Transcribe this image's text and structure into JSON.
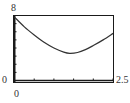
{
  "chart_data": {
    "type": "line",
    "title": "",
    "xlabel": "",
    "ylabel": "",
    "xlim": [
      0,
      2.5
    ],
    "ylim": [
      0,
      8
    ],
    "x_tick_step": 0.5,
    "y_tick_step": 1,
    "grid": false,
    "legend": null,
    "labels": {
      "ymax": "8",
      "ymin": "0",
      "xmin": "0",
      "xmax": "2.5"
    },
    "series": [
      {
        "name": "curve",
        "x": [
          0,
          0.25,
          0.5,
          0.75,
          1.0,
          1.25,
          1.4,
          1.6,
          1.8,
          2.0,
          2.25,
          2.5
        ],
        "y": [
          7.8,
          6.6,
          5.6,
          4.7,
          4.0,
          3.5,
          3.35,
          3.45,
          3.8,
          4.3,
          5.0,
          5.8
        ]
      }
    ],
    "colors": {
      "frame": "#1a1a1a",
      "curve": "#333333",
      "background": "#ffffff"
    }
  }
}
